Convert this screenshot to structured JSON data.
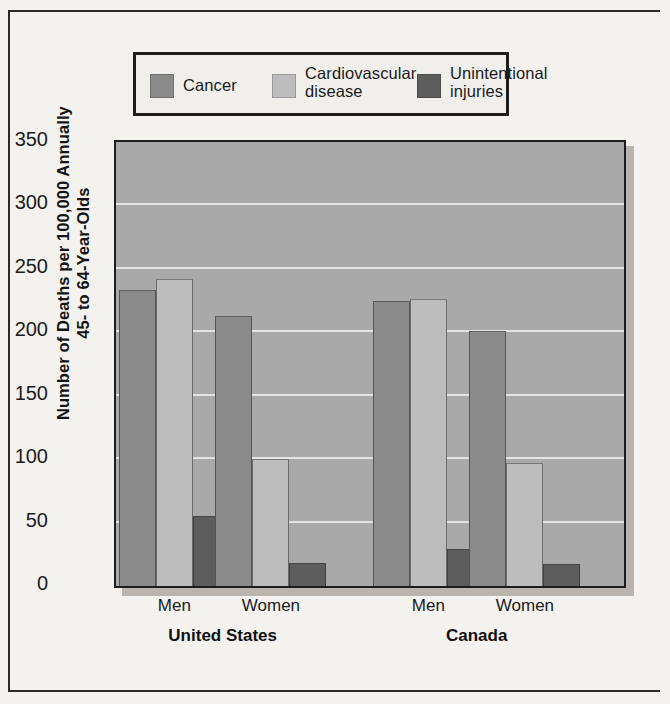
{
  "chart_data": {
    "type": "bar",
    "title": "",
    "xlabel": "",
    "ylabel": "Number of Deaths per 100,000 Annually\n45- to 64-Year-Olds",
    "ylim": [
      0,
      350
    ],
    "yticks": [
      0,
      50,
      100,
      150,
      200,
      250,
      300,
      350
    ],
    "ytick_labels": [
      "0",
      "50",
      "100",
      "150",
      "200",
      "250",
      "300",
      "350"
    ],
    "grid": true,
    "legend_position": "top",
    "categories": [
      "Men",
      "Women",
      "Men",
      "Women"
    ],
    "group_labels": [
      "United States",
      "Canada"
    ],
    "groups": [
      {
        "name": "United States",
        "categories": [
          {
            "label": "Men",
            "values": [
              233,
              242,
              55
            ]
          },
          {
            "label": "Women",
            "values": [
              213,
              100,
              18
            ]
          }
        ]
      },
      {
        "name": "Canada",
        "categories": [
          {
            "label": "Men",
            "values": [
              225,
              226,
              29
            ]
          },
          {
            "label": "Women",
            "values": [
              201,
              97,
              17
            ]
          }
        ]
      }
    ],
    "series": [
      {
        "name": "Cancer",
        "color": "#8a8a8a",
        "values": [
          233,
          213,
          225,
          201
        ]
      },
      {
        "name": "Cardiovascular\ndisease",
        "color": "#bdbdbd",
        "values": [
          242,
          100,
          226,
          97
        ]
      },
      {
        "name": "Unintentional\ninjuries",
        "color": "#5d5d5d",
        "values": [
          55,
          18,
          29,
          17
        ]
      }
    ],
    "legend": [
      {
        "label": "Cancer",
        "color": "#8a8a8a"
      },
      {
        "label": "Cardiovascular\ndisease",
        "color": "#bdbdbd"
      },
      {
        "label": "Unintentional\ninjuries",
        "color": "#5d5d5d"
      }
    ],
    "plot_background": "#a9a9a9",
    "gridline_color": "#efefef"
  }
}
